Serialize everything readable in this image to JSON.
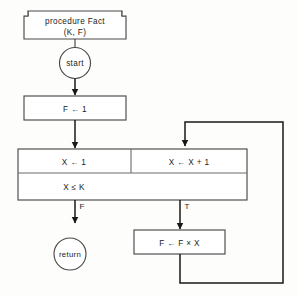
{
  "diagram": {
    "title_block": {
      "line1": "procedure Fact",
      "line2": "(K, F)",
      "shape": "flag-box"
    },
    "nodes": [
      {
        "id": "start",
        "label": "start",
        "shape": "circle"
      },
      {
        "id": "init_f",
        "label": "F ← 1",
        "shape": "rect"
      },
      {
        "id": "init_x",
        "label": "X ← 1",
        "shape": "rect-cell"
      },
      {
        "id": "incr_x",
        "label": "X ← X + 1",
        "shape": "rect-cell"
      },
      {
        "id": "condition",
        "label": "X ≤ K",
        "shape": "rect-wide"
      },
      {
        "id": "return",
        "label": "return",
        "shape": "circle"
      },
      {
        "id": "accumulate",
        "label": "F ← F × X",
        "shape": "rect"
      }
    ],
    "branch_labels": {
      "false": "F",
      "true": "T"
    },
    "colors": {
      "background": "#fdfdfb",
      "box_fill": "#ffffff",
      "box_stroke": "#4a4a4a",
      "line": "#181818",
      "text": "#1b1b1b",
      "divider": "#6a6a6a"
    }
  }
}
